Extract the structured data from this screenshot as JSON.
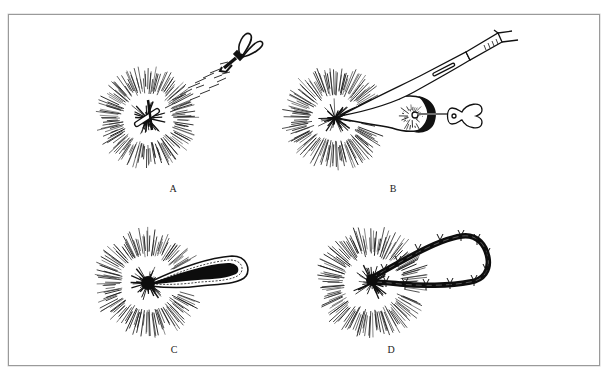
{
  "figure": {
    "panels": [
      {
        "id": "A",
        "label": "A",
        "description": "Probe inserted into fistula tract from wound center"
      },
      {
        "id": "B",
        "label": "B",
        "description": "Scalpel incising tissue over the probe"
      },
      {
        "id": "C",
        "label": "C",
        "description": "Opened tract shown as dark teardrop extending from wound"
      },
      {
        "id": "D",
        "label": "D",
        "description": "Tract closed with a sutured loop"
      }
    ],
    "colors": {
      "frame": "#9a9a9a",
      "ink": "#111111",
      "background": "#ffffff"
    }
  }
}
